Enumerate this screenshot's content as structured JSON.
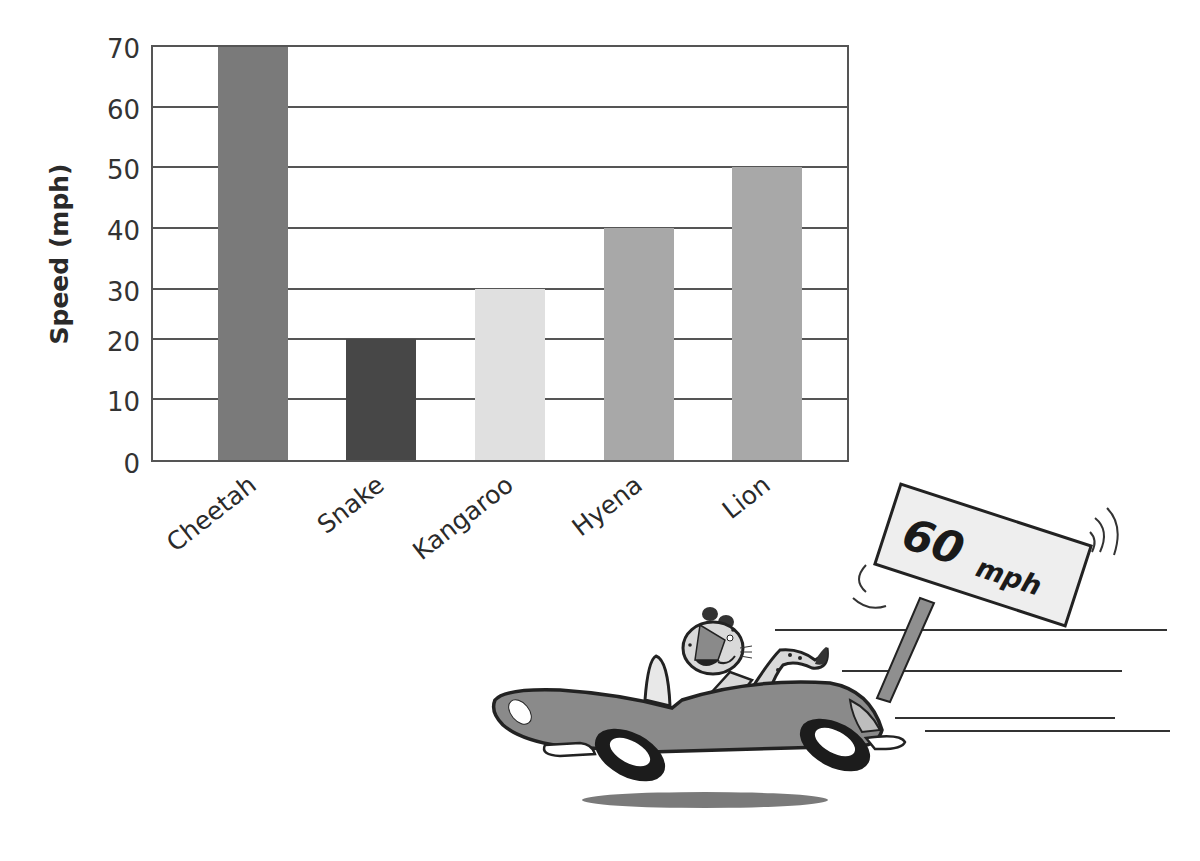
{
  "chart_data": {
    "type": "bar",
    "title": "",
    "xlabel": "",
    "ylabel": "Speed (mph)",
    "categories": [
      "Cheetah",
      "Snake",
      "Kangaroo",
      "Hyena",
      "Lion"
    ],
    "values": [
      70,
      20,
      30,
      40,
      50
    ],
    "colors": [
      "#7a7a7a",
      "#474747",
      "#e0e0e0",
      "#a8a8a8",
      "#a8a8a8"
    ],
    "yticks": [
      0,
      10,
      20,
      30,
      40,
      50,
      60,
      70
    ],
    "ylim": [
      0,
      70
    ],
    "grid": true,
    "legend": null
  },
  "illustration": {
    "description": "Cartoon cheetah driving a convertible past a road sign",
    "sign_number": "60",
    "sign_unit": "mph"
  }
}
